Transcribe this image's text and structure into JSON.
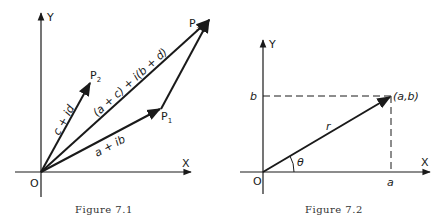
{
  "figure1": {
    "caption": "Figure 7.1",
    "axis_x_label": "X",
    "axis_y_label": "Y",
    "origin_label": "O",
    "points": {
      "p1": "P",
      "p1_sub": "1",
      "p2": "P",
      "p2_sub": "2",
      "p3": "P",
      "p3_sub": "3"
    },
    "vector_labels": {
      "op1": "a + ib",
      "op2": "c + id",
      "op3": "(a + c) + i(b + d)"
    }
  },
  "figure2": {
    "caption": "Figure 7.2",
    "axis_x_label": "X",
    "axis_y_label": "Y",
    "origin_label": "O",
    "point_label": "(a,b)",
    "x_tick_label": "a",
    "y_tick_label": "b",
    "radius_label": "r",
    "angle_label": "θ"
  },
  "colors": {
    "ink": "#1a1a1a",
    "caption": "#333333",
    "background": "#ffffff"
  }
}
